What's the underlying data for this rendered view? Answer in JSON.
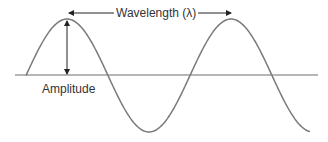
{
  "diagram": {
    "labels": {
      "wavelength": "Wavelength (λ)",
      "amplitude": "Amplitude"
    },
    "colors": {
      "wave": "#7a7a7a",
      "axis": "#6e6e6e",
      "arrow": "#222222",
      "text": "#333333"
    },
    "geometry": {
      "baseline_y": 75,
      "axis_x": [
        15,
        318
      ],
      "peak_y": 19,
      "trough_y": 132,
      "wave_start_x": 26,
      "wavelength_px": 164,
      "wave_end_x": 310,
      "peaks_x": [
        67,
        232
      ],
      "troughs_x": [
        150,
        314
      ],
      "wavelength_arrow": {
        "y": 13,
        "x1": 69,
        "x2": 231
      },
      "amplitude_arrow": {
        "x": 67,
        "y1": 20,
        "y2": 75
      }
    }
  }
}
